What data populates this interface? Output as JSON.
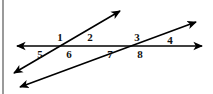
{
  "figure": {
    "width": 213,
    "height": 94,
    "background_color": "#ffffff",
    "line_color": "#000000",
    "label_color": "#111111",
    "border_color": "#9a9a9a"
  },
  "lines": [
    {
      "name": "horizontal-line",
      "label": "horizontal line",
      "x1": 17,
      "y1": 46,
      "x2": 202,
      "y2": 46,
      "arrow_start": true,
      "arrow_end": true,
      "stroke_width": 1.6
    },
    {
      "name": "transversal-steep",
      "label": "first transversal",
      "x1": 14,
      "y1": 73,
      "x2": 120,
      "y2": 11,
      "arrow_start": true,
      "arrow_end": true,
      "stroke_width": 1.6
    },
    {
      "name": "transversal-shallow",
      "label": "second transversal",
      "x1": 20,
      "y1": 87,
      "x2": 196,
      "y2": 22,
      "arrow_start": true,
      "arrow_end": true,
      "stroke_width": 1.6
    }
  ],
  "intersections": [
    {
      "name": "intersection-left",
      "x": 65,
      "y": 46
    },
    {
      "name": "intersection-right",
      "x": 142,
      "y": 46
    }
  ],
  "angle_labels": [
    {
      "id": "1",
      "text": "1",
      "x": 60,
      "y": 37
    },
    {
      "id": "2",
      "text": "2",
      "x": 90,
      "y": 37
    },
    {
      "id": "3",
      "text": "3",
      "x": 137,
      "y": 37
    },
    {
      "id": "4",
      "text": "4",
      "x": 170,
      "y": 40
    },
    {
      "id": "5",
      "text": "5",
      "x": 40,
      "y": 54
    },
    {
      "id": "6",
      "text": "6",
      "x": 69,
      "y": 54
    },
    {
      "id": "7",
      "text": "7",
      "x": 110,
      "y": 54
    },
    {
      "id": "8",
      "text": "8",
      "x": 140,
      "y": 54
    }
  ]
}
